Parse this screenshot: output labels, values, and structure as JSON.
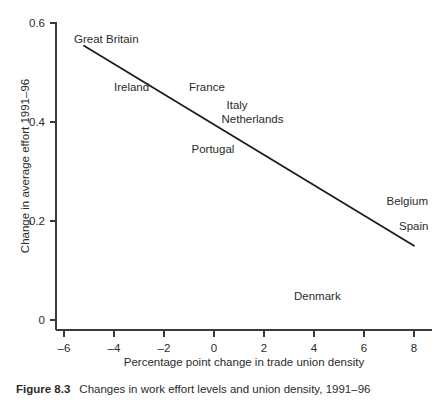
{
  "figure": {
    "caption_label": "Figure 8.3",
    "caption_text": "Changes in work effort levels and union density, 1991–96"
  },
  "chart_data": {
    "type": "scatter",
    "title": "",
    "xlabel": "Percentage point change in trade union density",
    "ylabel": "Change in average effort 1991–96",
    "xlim": [
      -6.5,
      8.6
    ],
    "ylim": [
      -0.02,
      0.62
    ],
    "xticks": [
      -6,
      -4,
      -2,
      0,
      2,
      4,
      6,
      8
    ],
    "xtick_labels": [
      "–6",
      "–4",
      "–2",
      "0",
      "2",
      "4",
      "6",
      "8"
    ],
    "yticks": [
      0,
      0.2,
      0.4,
      0.6
    ],
    "ytick_labels": [
      "0",
      "0.2",
      "0.4",
      "0.6"
    ],
    "grid": false,
    "legend": "none",
    "annotations": [
      {
        "label": "Great Britain",
        "x": -5.6,
        "y": 0.565
      },
      {
        "label": "Ireland",
        "x": -4.0,
        "y": 0.468
      },
      {
        "label": "France",
        "x": -1.0,
        "y": 0.468
      },
      {
        "label": "Italy",
        "x": 0.5,
        "y": 0.432
      },
      {
        "label": "Netherlands",
        "x": 0.3,
        "y": 0.404
      },
      {
        "label": "Portugal",
        "x": -0.9,
        "y": 0.343
      },
      {
        "label": "Belgium",
        "x": 6.9,
        "y": 0.239
      },
      {
        "label": "Spain",
        "x": 7.4,
        "y": 0.187
      },
      {
        "label": "Denmark",
        "x": 3.2,
        "y": 0.046
      }
    ],
    "trend_line": {
      "name": "fitted regression line",
      "x": [
        -5.2,
        8.0
      ],
      "y": [
        0.554,
        0.15
      ]
    }
  }
}
